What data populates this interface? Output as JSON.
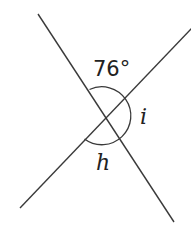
{
  "diagram": {
    "type": "intersecting-lines-angles",
    "angles": [
      {
        "id": "top",
        "label": "76°"
      },
      {
        "id": "right",
        "label": "i"
      },
      {
        "id": "bottom",
        "label": "h"
      }
    ],
    "colors": {
      "line": "#3a3a3a",
      "text": "#222222",
      "background": "#ffffff"
    }
  }
}
